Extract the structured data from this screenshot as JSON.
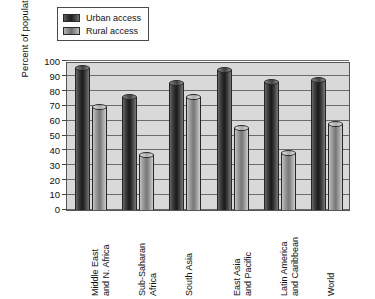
{
  "chart_data": {
    "type": "bar",
    "title": "",
    "subtitle": "",
    "xlabel": "",
    "ylabel": "Percent of population",
    "ylim": [
      0,
      100
    ],
    "ytick_step": 10,
    "yticks": [
      "100",
      "90",
      "80",
      "70",
      "60",
      "50",
      "40",
      "30",
      "20",
      "10",
      "0"
    ],
    "grid": true,
    "legend_position": "top-left",
    "categories": [
      "Middle East and N. Africa",
      "Sub-Saharan Africa",
      "South Asia",
      "East Asia and Pacific",
      "Latin America and Caribbean",
      "World"
    ],
    "category_lines": [
      [
        "Middle East",
        "and N. Africa"
      ],
      [
        "Sub-Saharan",
        "Africa"
      ],
      [
        "South Asia",
        ""
      ],
      [
        "East Asia",
        "and Pacific"
      ],
      [
        "Latin America",
        "and Caribbean"
      ],
      [
        "World",
        ""
      ]
    ],
    "series": [
      {
        "name": "Urban access",
        "color": "#2c2c2c",
        "values": [
          97,
          78,
          87,
          96,
          88,
          89
        ]
      },
      {
        "name": "Rural access",
        "color": "#8a8a8a",
        "values": [
          71,
          39,
          78,
          57,
          40,
          60
        ]
      }
    ]
  },
  "legend": {
    "items": [
      {
        "label": "Urban access",
        "swatch": "urban"
      },
      {
        "label": "Rural access",
        "swatch": "rural"
      }
    ]
  },
  "colors": {
    "plot_background": "#d9d9d9",
    "gridline": "#6b6b6b",
    "axis": "#555555",
    "urban_bar": "#2c2c2c",
    "rural_bar": "#8a8a8a",
    "text": "#111111"
  }
}
